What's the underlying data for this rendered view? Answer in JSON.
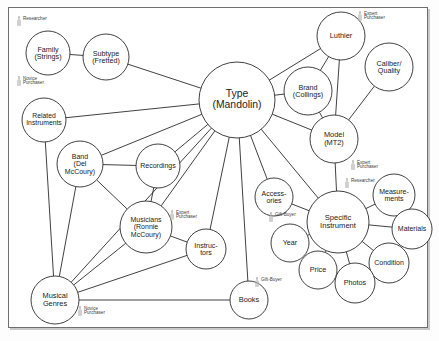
{
  "diagram": {
    "frame": {
      "x": 8,
      "y": 7,
      "width": 418,
      "height": 319
    },
    "style": {
      "node_fill": "#ffffff",
      "node_stroke": "#2b2b2b",
      "edge_stroke": "#2b2b2b",
      "annotation_color": "#3c3c3c",
      "background": "#ffffff",
      "frame_stroke": "#6f6f6f"
    },
    "nodes": [
      {
        "id": "family",
        "label": [
          "Family",
          "(Strings)"
        ],
        "cx": 48,
        "cy": 53,
        "r": 22,
        "fontSize": 7.2
      },
      {
        "id": "subtype",
        "label": [
          "Subtype",
          "(Fretted)"
        ],
        "cx": 106,
        "cy": 57,
        "r": 23,
        "fontSize": 7.2
      },
      {
        "id": "related",
        "label": [
          "Related",
          "Instruments"
        ],
        "cx": 44,
        "cy": 120,
        "r": 22,
        "fontSize": 6.8
      },
      {
        "id": "type",
        "label": [
          "Type",
          "(Mandolin)"
        ],
        "cx": 237,
        "cy": 100,
        "r": 38,
        "fontSize": 10.4
      },
      {
        "id": "luthier",
        "label": [
          "Luthier"
        ],
        "cx": 341,
        "cy": 36,
        "r": 24,
        "fontSize": 7.4
      },
      {
        "id": "brand",
        "label": [
          "Brand",
          "(Collings)"
        ],
        "cx": 308,
        "cy": 91,
        "r": 24,
        "fontSize": 7.2
      },
      {
        "id": "caliber",
        "label": [
          "Caliber/",
          "Quality"
        ],
        "cx": 389,
        "cy": 67,
        "r": 24,
        "fontSize": 7.2
      },
      {
        "id": "model",
        "label": [
          "Model",
          "(MT2)"
        ],
        "cx": 334,
        "cy": 139,
        "r": 24,
        "fontSize": 7.4
      },
      {
        "id": "band",
        "label": [
          "Band",
          "(Del",
          "McCoury)"
        ],
        "cx": 80,
        "cy": 164,
        "r": 23,
        "fontSize": 7.0
      },
      {
        "id": "recordings",
        "label": [
          "Recordings"
        ],
        "cx": 158,
        "cy": 166,
        "r": 22,
        "fontSize": 7.0
      },
      {
        "id": "musicians",
        "label": [
          "Musicians",
          "(Ronnie",
          "McCoury)"
        ],
        "cx": 146,
        "cy": 227,
        "r": 26,
        "fontSize": 7.0
      },
      {
        "id": "instructors",
        "label": [
          "Instruc-",
          "tors"
        ],
        "cx": 206,
        "cy": 249,
        "r": 20,
        "fontSize": 7.0
      },
      {
        "id": "genres",
        "label": [
          "Musical",
          "Genres"
        ],
        "cx": 55,
        "cy": 300,
        "r": 24,
        "fontSize": 7.4
      },
      {
        "id": "accessories",
        "label": [
          "Access-",
          "ories"
        ],
        "cx": 274,
        "cy": 197,
        "r": 19,
        "fontSize": 7.0
      },
      {
        "id": "books",
        "label": [
          "Books"
        ],
        "cx": 249,
        "cy": 300,
        "r": 19,
        "fontSize": 7.4
      },
      {
        "id": "specific",
        "label": [
          "Specific",
          "Instrument"
        ],
        "cx": 338,
        "cy": 222,
        "r": 31,
        "fontSize": 7.6
      },
      {
        "id": "measurements",
        "label": [
          "Measure-",
          "ments"
        ],
        "cx": 394,
        "cy": 195,
        "r": 21,
        "fontSize": 7.0
      },
      {
        "id": "materials",
        "label": [
          "Materials"
        ],
        "cx": 412,
        "cy": 229,
        "r": 20,
        "fontSize": 7.0
      },
      {
        "id": "condition",
        "label": [
          "Condition"
        ],
        "cx": 389,
        "cy": 263,
        "r": 20,
        "fontSize": 7.0
      },
      {
        "id": "photos",
        "label": [
          "Photos"
        ],
        "cx": 355,
        "cy": 283,
        "r": 20,
        "fontSize": 7.2
      },
      {
        "id": "price",
        "label": [
          "Price"
        ],
        "cx": 318,
        "cy": 270,
        "r": 19,
        "fontSize": 7.2
      },
      {
        "id": "year",
        "label": [
          "Year"
        ],
        "cx": 290,
        "cy": 243,
        "r": 19,
        "fontSize": 7.2
      }
    ],
    "edges": [
      {
        "from": "family",
        "to": "subtype"
      },
      {
        "from": "subtype",
        "to": "type"
      },
      {
        "from": "related",
        "to": "type"
      },
      {
        "from": "related",
        "to": "genres"
      },
      {
        "from": "type",
        "to": "luthier"
      },
      {
        "from": "type",
        "to": "brand"
      },
      {
        "from": "brand",
        "to": "luthier"
      },
      {
        "from": "brand",
        "to": "model"
      },
      {
        "from": "type",
        "to": "model"
      },
      {
        "from": "luthier",
        "to": "model"
      },
      {
        "from": "caliber",
        "to": "model"
      },
      {
        "from": "model",
        "to": "specific"
      },
      {
        "from": "type",
        "to": "band"
      },
      {
        "from": "type",
        "to": "recordings"
      },
      {
        "from": "type",
        "to": "musicians"
      },
      {
        "from": "type",
        "to": "instructors"
      },
      {
        "from": "type",
        "to": "accessories"
      },
      {
        "from": "type",
        "to": "books"
      },
      {
        "from": "type",
        "to": "specific"
      },
      {
        "from": "type",
        "to": "genres"
      },
      {
        "from": "band",
        "to": "recordings"
      },
      {
        "from": "band",
        "to": "musicians"
      },
      {
        "from": "band",
        "to": "genres"
      },
      {
        "from": "recordings",
        "to": "musicians"
      },
      {
        "from": "musicians",
        "to": "instructors"
      },
      {
        "from": "musicians",
        "to": "genres"
      },
      {
        "from": "instructors",
        "to": "genres"
      },
      {
        "from": "genres",
        "to": "books"
      },
      {
        "from": "specific",
        "to": "measurements"
      },
      {
        "from": "specific",
        "to": "materials"
      },
      {
        "from": "specific",
        "to": "condition"
      },
      {
        "from": "specific",
        "to": "photos"
      },
      {
        "from": "specific",
        "to": "price"
      },
      {
        "from": "specific",
        "to": "year"
      },
      {
        "from": "specific",
        "to": "accessories"
      }
    ],
    "annotations": [
      {
        "id": "ann-researcher-family",
        "icon": "person-icon",
        "lines": [
          "Researcher"
        ],
        "x": 17,
        "y": 16
      },
      {
        "id": "ann-novice-family",
        "icon": "person-icon",
        "lines": [
          "Novice",
          "Purchaser"
        ],
        "x": 17,
        "y": 76
      },
      {
        "id": "ann-expert-luthier",
        "icon": "person-icon",
        "lines": [
          "Expert",
          "Purchaser"
        ],
        "x": 358,
        "y": 11
      },
      {
        "id": "ann-expert-model",
        "icon": "person-icon",
        "lines": [
          "Expert",
          "Purchaser"
        ],
        "x": 351,
        "y": 160
      },
      {
        "id": "ann-researcher-specific",
        "icon": "person-icon",
        "lines": [
          "Researcher"
        ],
        "x": 345,
        "y": 178
      },
      {
        "id": "ann-expert-musicians",
        "icon": "person-icon",
        "lines": [
          "Expert",
          "Purchaser"
        ],
        "x": 170,
        "y": 210
      },
      {
        "id": "ann-giftbuyer-accessories",
        "icon": "person-icon",
        "lines": [
          "Gift-Buyer"
        ],
        "x": 269,
        "y": 212
      },
      {
        "id": "ann-giftbuyer-books",
        "icon": "person-icon",
        "lines": [
          "Gift-Buyer"
        ],
        "x": 255,
        "y": 277
      },
      {
        "id": "ann-novice-genres",
        "icon": "person-icon",
        "lines": [
          "Novice",
          "Purchaser"
        ],
        "x": 78,
        "y": 306
      }
    ]
  }
}
